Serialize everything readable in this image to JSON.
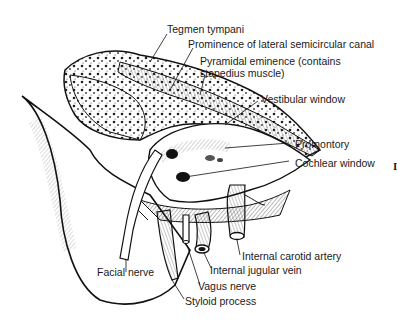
{
  "diagram": {
    "type": "anatomical-illustration",
    "labels": [
      {
        "id": "tegmen",
        "text": "Tegmen tympani"
      },
      {
        "id": "lateral_canal",
        "text": "Prominence of lateral semicircular canal"
      },
      {
        "id": "pyramidal_1",
        "text": "Pyramidal eminence (contains"
      },
      {
        "id": "pyramidal_2",
        "text": "stapedius muscle)"
      },
      {
        "id": "vestibular",
        "text": "Vestibular window"
      },
      {
        "id": "promontory",
        "text": "Promontory"
      },
      {
        "id": "cochlear",
        "text": "Cochlear window"
      },
      {
        "id": "carotid",
        "text": "Internal carotid artery"
      },
      {
        "id": "jugular",
        "text": "Internal jugular vein"
      },
      {
        "id": "vagus",
        "text": "Vagus nerve"
      },
      {
        "id": "styloid",
        "text": "Styloid process"
      },
      {
        "id": "facial",
        "text": "Facial nerve"
      }
    ],
    "margin_mark": "I",
    "colors": {
      "ink": "#1a1a1a",
      "background": "#ffffff"
    }
  }
}
